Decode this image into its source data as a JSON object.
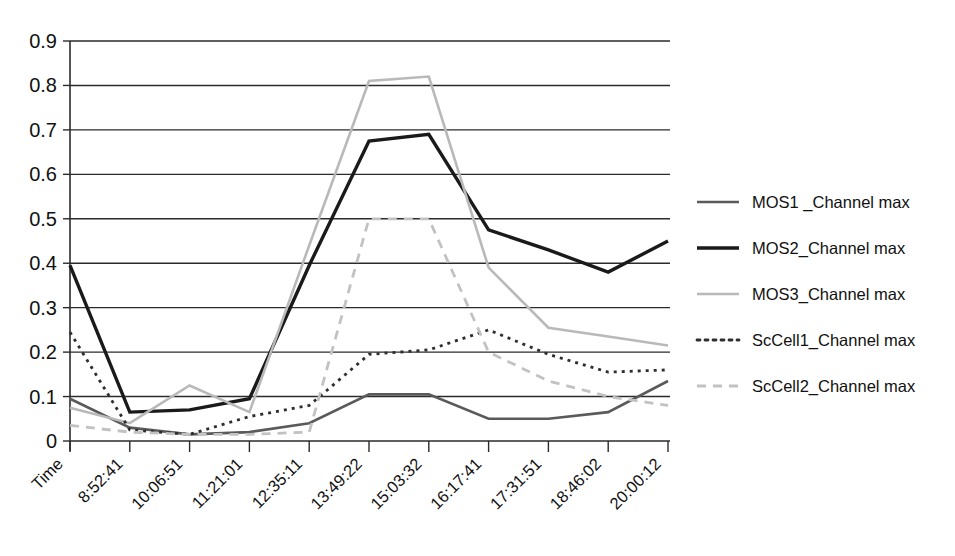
{
  "chart_data": {
    "type": "line",
    "title": "",
    "subtitle": "",
    "xlabel": "",
    "ylabel": "",
    "grid": true,
    "legend_position": "right",
    "ylim": [
      0,
      0.9
    ],
    "ytick_labels": [
      "0.9",
      "0.8",
      "0.7",
      "0.6",
      "0.5",
      "0.4",
      "0.3",
      "0.2",
      "0.1",
      "0"
    ],
    "ytick_values": [
      0.9,
      0.8,
      0.7,
      0.6,
      0.5,
      0.4,
      0.3,
      0.2,
      0.1,
      0
    ],
    "categories": [
      "Time",
      "8:52:41",
      "10:06:51",
      "11:21:01",
      "12:35:11",
      "13:49:22",
      "15:03:32",
      "16:17:41",
      "17:31:51",
      "18:46:02",
      "20:00:12"
    ],
    "series": [
      {
        "name": "MOS1 _Channel max",
        "style": "solid",
        "color": "#5a5a5a",
        "width": 2.6,
        "values": [
          0.095,
          0.03,
          0.015,
          0.02,
          0.04,
          0.105,
          0.105,
          0.05,
          0.05,
          0.065,
          0.135
        ]
      },
      {
        "name": "MOS2_Channel max",
        "style": "solid",
        "color": "#1a1a1a",
        "width": 3.4,
        "values": [
          0.395,
          0.065,
          0.07,
          0.095,
          0.395,
          0.675,
          0.69,
          0.475,
          0.43,
          0.38,
          0.45
        ]
      },
      {
        "name": "MOS3_Channel max",
        "style": "solid",
        "color": "#b9b9b9",
        "width": 2.6,
        "values": [
          0.075,
          0.04,
          0.125,
          0.065,
          0.44,
          0.81,
          0.82,
          0.39,
          0.255,
          0.235,
          0.215
        ]
      },
      {
        "name": "ScCell1_Channel max",
        "style": "dotted",
        "color": "#2e2e2e",
        "width": 2.8,
        "dash": "3 5",
        "values": [
          0.245,
          0.025,
          0.015,
          0.055,
          0.08,
          0.195,
          0.205,
          0.25,
          0.195,
          0.155,
          0.16
        ]
      },
      {
        "name": "ScCell2_Channel max",
        "style": "dashed",
        "color": "#c2c2c2",
        "width": 2.8,
        "dash": "9 7",
        "values": [
          0.035,
          0.02,
          0.015,
          0.015,
          0.02,
          0.5,
          0.5,
          0.2,
          0.135,
          0.1,
          0.08
        ]
      }
    ]
  },
  "legend": {
    "items": [
      {
        "label": "MOS1 _Channel max"
      },
      {
        "label": "MOS2_Channel max"
      },
      {
        "label": "MOS3_Channel max"
      },
      {
        "label": "ScCell1_Channel max"
      },
      {
        "label": "ScCell2_Channel max"
      }
    ]
  }
}
